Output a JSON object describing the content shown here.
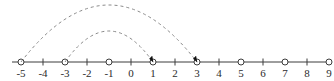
{
  "figure": {
    "axis": {
      "name": "number-line",
      "min": -5,
      "max": 9,
      "start_px": 12,
      "end_px": 331,
      "y_px": 62,
      "pixels_per_unit": 22.0,
      "origin_px": 131,
      "color": "#3c3c3c",
      "line_width": 1
    },
    "tick_labels": [
      "-5",
      "-4",
      "-3",
      "-2",
      "-1",
      "0",
      "1",
      "2",
      "3",
      "4",
      "5",
      "6",
      "7",
      "8",
      "9"
    ],
    "tick_values": [
      -5,
      -4,
      -3,
      -2,
      -1,
      0,
      1,
      2,
      3,
      4,
      5,
      6,
      7,
      8,
      9
    ],
    "open_circle_values": [
      -5,
      -3,
      -1,
      1,
      3,
      5,
      7,
      9
    ],
    "plain_tick_values": [
      -4,
      -2,
      0,
      2,
      4,
      6,
      8
    ],
    "marker": {
      "radius_px": 3,
      "fill": "#ffffff",
      "stroke": "#3c3c3c"
    },
    "arcs": [
      {
        "name": "outer-arc",
        "from_value": -5,
        "to_value": 3,
        "apex_y_px": 5,
        "dashed": true,
        "dash_pattern": "3,3",
        "color": "#8a8a8a",
        "arrowhead": true,
        "arrowhead_color": "#111111",
        "label": "jump from -5 to 3"
      },
      {
        "name": "inner-arc",
        "from_value": -3,
        "to_value": 1,
        "apex_y_px": 31,
        "dashed": true,
        "dash_pattern": "3,3",
        "color": "#8a8a8a",
        "arrowhead": true,
        "arrowhead_color": "#111111",
        "label": "jump from -3 to 1"
      }
    ]
  },
  "chart_data": {
    "type": "line",
    "xlabel": "",
    "ylabel": "",
    "xlim": [
      -5,
      9
    ],
    "grid": false,
    "legend": "none",
    "categories": [
      "-5",
      "-4",
      "-3",
      "-2",
      "-1",
      "0",
      "1",
      "2",
      "3",
      "4",
      "5",
      "6",
      "7",
      "8",
      "9"
    ],
    "values": [
      -5,
      -4,
      -3,
      -2,
      -1,
      0,
      1,
      2,
      3,
      4,
      5,
      6,
      7,
      8,
      9
    ],
    "annotations": [
      {
        "kind": "open-circle",
        "x": -5
      },
      {
        "kind": "open-circle",
        "x": -3
      },
      {
        "kind": "open-circle",
        "x": -1
      },
      {
        "kind": "open-circle",
        "x": 1
      },
      {
        "kind": "open-circle",
        "x": 3
      },
      {
        "kind": "open-circle",
        "x": 5
      },
      {
        "kind": "open-circle",
        "x": 7
      },
      {
        "kind": "open-circle",
        "x": 9
      },
      {
        "kind": "dashed-arc-arrow",
        "from": -5,
        "to": 3,
        "span": 8
      },
      {
        "kind": "dashed-arc-arrow",
        "from": -3,
        "to": 1,
        "span": 4
      }
    ]
  }
}
